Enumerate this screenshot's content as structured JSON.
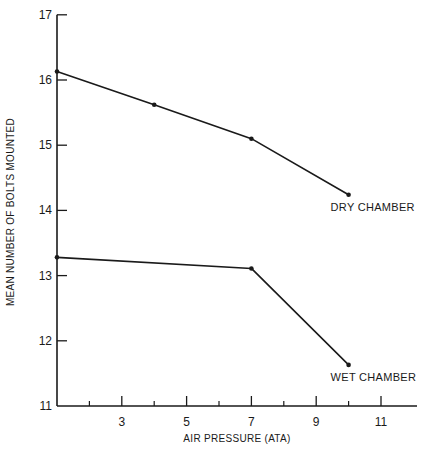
{
  "chart_data": {
    "type": "line",
    "title": "",
    "xlabel": "AIR PRESSURE (ATA)",
    "ylabel": "MEAN NUMBER OF BOLTS MOUNTED",
    "xlim": [
      1,
      12.1
    ],
    "ylim": [
      11,
      17
    ],
    "x_ticks_major": [
      3,
      5,
      7,
      9,
      11
    ],
    "x_ticks_minor": [
      2,
      4,
      6,
      8,
      10
    ],
    "y_ticks": [
      11,
      12,
      13,
      14,
      15,
      16,
      17
    ],
    "grid": false,
    "legend": "inline labels at line ends",
    "series": [
      {
        "name": "DRY CHAMBER",
        "x": [
          1,
          4,
          7,
          10
        ],
        "values": [
          16.13,
          15.62,
          15.1,
          14.24
        ]
      },
      {
        "name": "WET CHAMBER",
        "x": [
          1,
          7,
          10
        ],
        "values": [
          13.28,
          13.11,
          11.63
        ]
      }
    ]
  },
  "colors": {
    "ink": "#1a1a1a",
    "background": "#ffffff"
  }
}
